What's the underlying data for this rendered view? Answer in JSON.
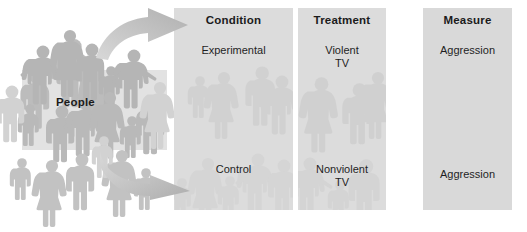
{
  "figure": {
    "type": "experiment-design-diagram",
    "source_group": {
      "label": "People",
      "icon": "people-silhouettes-icon"
    },
    "arrows": [
      {
        "name": "arrow-to-experimental",
        "direction": "up-right"
      },
      {
        "name": "arrow-to-control",
        "direction": "down-right"
      }
    ],
    "columns": [
      {
        "id": "condition",
        "header": "Condition",
        "cells": [
          {
            "id": "experimental",
            "lines": [
              "Experimental"
            ]
          },
          {
            "id": "control",
            "lines": [
              "Control"
            ]
          }
        ]
      },
      {
        "id": "treatment",
        "header": "Treatment",
        "cells": [
          {
            "id": "violent-tv",
            "lines": [
              "Violent",
              "TV"
            ]
          },
          {
            "id": "nonviolent-tv",
            "lines": [
              "Nonviolent",
              "TV"
            ]
          }
        ]
      },
      {
        "id": "measure",
        "header": "Measure",
        "cells": [
          {
            "id": "aggression-top",
            "lines": [
              "Aggression"
            ]
          },
          {
            "id": "aggression-bottom",
            "lines": [
              "Aggression"
            ]
          }
        ]
      }
    ],
    "colors": {
      "background": "#ffffff",
      "column_fill": "#dcdcdc",
      "people_box_fill": "#e2e2e2",
      "silhouette": "#b8b8b8",
      "arrow_fill": "#c9c9c9",
      "text": "#1b1b1b"
    }
  }
}
